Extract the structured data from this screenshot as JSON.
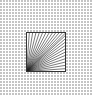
{
  "image": {
    "background": "checkered-dot-pattern",
    "background_dot_color": "#c4c4c4",
    "icon": "radial-lines-square-icon",
    "line_color": "#222222",
    "border_color": "#333333",
    "ray_count": 24
  }
}
